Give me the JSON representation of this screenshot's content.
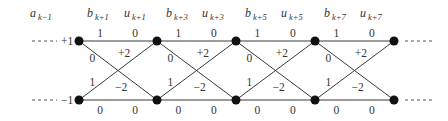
{
  "diagram": {
    "type": "trellis",
    "headers": [
      {
        "base": "a",
        "sub": "k−1",
        "x": 30
      },
      {
        "base": "b",
        "sub": "k+1",
        "x": 87
      },
      {
        "base": "u",
        "sub": "k+1",
        "x": 124
      },
      {
        "base": "b",
        "sub": "k+3",
        "x": 166
      },
      {
        "base": "u",
        "sub": "k+3",
        "x": 202
      },
      {
        "base": "b",
        "sub": "k+5",
        "x": 245
      },
      {
        "base": "u",
        "sub": "k+5",
        "x": 281
      },
      {
        "base": "b",
        "sub": "k+7",
        "x": 324
      },
      {
        "base": "u",
        "sub": "k+7",
        "x": 360
      }
    ],
    "states": [
      {
        "label": "+1",
        "y": 41
      },
      {
        "label": "−1",
        "y": 100
      }
    ],
    "node_x": [
      79,
      157,
      236,
      315,
      394
    ],
    "stages": [
      {
        "top_straight": {
          "b": "1",
          "u": "0"
        },
        "top_to_bottom": {
          "b": "0",
          "u": "+2"
        },
        "bottom_to_top": {
          "b": "1",
          "u": "−2"
        },
        "bottom_straight": {
          "b": "0",
          "u": "0"
        }
      },
      {
        "top_straight": {
          "b": "1",
          "u": "0"
        },
        "top_to_bottom": {
          "b": "0",
          "u": "+2"
        },
        "bottom_to_top": {
          "b": "1",
          "u": "−2"
        },
        "bottom_straight": {
          "b": "0",
          "u": "0"
        }
      },
      {
        "top_straight": {
          "b": "1",
          "u": "0"
        },
        "top_to_bottom": {
          "b": "0",
          "u": "+2"
        },
        "bottom_to_top": {
          "b": "1",
          "u": "−2"
        },
        "bottom_straight": {
          "b": "0",
          "u": "0"
        }
      },
      {
        "top_straight": {
          "b": "1",
          "u": "0"
        },
        "top_to_bottom": {
          "b": "0",
          "u": "+2"
        },
        "bottom_to_top": {
          "b": "1",
          "u": "−2"
        },
        "bottom_straight": {
          "b": "0",
          "u": "0"
        }
      }
    ],
    "continuation": "- - - -"
  }
}
